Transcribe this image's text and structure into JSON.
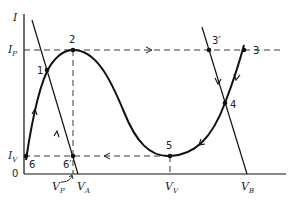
{
  "diagram": {
    "axes": {
      "y_label": "I",
      "origin_label": "0",
      "y_ticks": [
        {
          "label": "I",
          "sub": "P"
        },
        {
          "label": "I",
          "sub": "V"
        }
      ],
      "x_ticks": [
        {
          "label": "V",
          "sub": "P"
        },
        {
          "label": "V",
          "sub": "A"
        },
        {
          "label": "V",
          "sub": "V"
        },
        {
          "label": "V",
          "sub": "B"
        }
      ]
    },
    "points": [
      {
        "id": "1",
        "label": "1"
      },
      {
        "id": "2",
        "label": "2"
      },
      {
        "id": "3",
        "label": "3"
      },
      {
        "id": "3p",
        "label": "3′"
      },
      {
        "id": "4",
        "label": "4"
      },
      {
        "id": "5",
        "label": "5"
      },
      {
        "id": "6",
        "label": "6"
      },
      {
        "id": "6p",
        "label": "6′"
      }
    ],
    "colors": {
      "line": "#111111",
      "background": "#ffffff"
    }
  }
}
